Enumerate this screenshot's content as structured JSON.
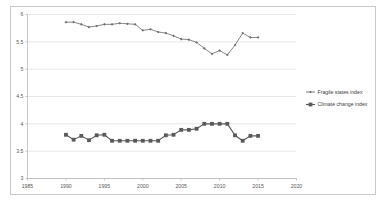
{
  "chart_data": {
    "type": "line",
    "title": "",
    "subtitle": "",
    "xlabel": "",
    "ylabel": "",
    "xlim": [
      1985,
      2020
    ],
    "ylim": [
      3,
      6
    ],
    "grid": "horizontal",
    "legend_position": "right",
    "x_tick_labels": [
      "1985",
      "1990",
      "1995",
      "2000",
      "2005",
      "2010",
      "2015",
      "2020"
    ],
    "x_ticks": [
      1985,
      1990,
      1995,
      2000,
      2005,
      2010,
      2015,
      2020
    ],
    "y_tick_labels": [
      "3",
      "3.5",
      "4",
      "4.5",
      "5",
      "5.5",
      "6"
    ],
    "y_ticks": [
      3,
      3.5,
      4,
      4.5,
      5,
      5.5,
      6
    ],
    "x": [
      1990,
      1991,
      1992,
      1993,
      1994,
      1995,
      1996,
      1997,
      1998,
      1999,
      2000,
      2001,
      2002,
      2003,
      2004,
      2005,
      2006,
      2007,
      2008,
      2009,
      2010,
      2011,
      2012,
      2013,
      2014,
      2015
    ],
    "series": [
      {
        "name": "Fragile states index",
        "marker": "diamond",
        "color": "#6e6e6e",
        "values": [
          5.86,
          5.86,
          5.82,
          5.77,
          5.79,
          5.82,
          5.82,
          5.84,
          5.83,
          5.82,
          5.71,
          5.73,
          5.68,
          5.66,
          5.61,
          5.55,
          5.54,
          5.49,
          5.38,
          5.28,
          5.34,
          5.26,
          5.44,
          5.66,
          5.58,
          5.58
        ]
      },
      {
        "name": "Climate change index",
        "marker": "square",
        "color": "#5a5a5a",
        "values": [
          3.8,
          3.71,
          3.78,
          3.7,
          3.79,
          3.8,
          3.69,
          3.69,
          3.69,
          3.69,
          3.69,
          3.69,
          3.69,
          3.79,
          3.8,
          3.89,
          3.89,
          3.91,
          4.0,
          4.0,
          4.0,
          4.0,
          3.79,
          3.69,
          3.78,
          3.78
        ]
      }
    ]
  },
  "legend": {
    "entries": [
      {
        "label": "Fragile states index"
      },
      {
        "label": "Climate change index"
      }
    ]
  },
  "colors": {
    "series_1": "#6e6e6e",
    "series_2": "#5a5a5a",
    "gridline": "#d9d9d9",
    "axis": "#b0b0b0",
    "frame": "#c9c9c9",
    "tick_text": "#595959"
  }
}
